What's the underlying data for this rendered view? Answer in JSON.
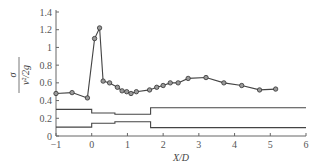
{
  "chart_data": {
    "type": "line",
    "title": "",
    "xlabel": "X/D",
    "ylabel": "σ / (v²/2g)",
    "ylabel_num": "σ",
    "ylabel_den": "v²/2g",
    "xlim": [
      -1,
      6
    ],
    "ylim": [
      0,
      1.4
    ],
    "xticks": [
      -1,
      0,
      1,
      2,
      3,
      4,
      5,
      6
    ],
    "xtick_labels": [
      "−1",
      "0",
      "1",
      "2",
      "3",
      "4",
      "5",
      "6"
    ],
    "yticks": [
      0,
      0.2,
      0.4,
      0.6,
      0.8,
      1,
      1.2,
      1.4
    ],
    "ytick_labels": [
      "0",
      "0.2",
      "0.4",
      "0.6",
      "0.8",
      "1",
      "1.2",
      "1.4"
    ],
    "grid": false,
    "legend": null,
    "series": [
      {
        "name": "measured",
        "marker": "circle",
        "x": [
          -1.0,
          -0.55,
          -0.12,
          0.08,
          0.22,
          0.32,
          0.5,
          0.72,
          0.85,
          0.98,
          1.1,
          1.25,
          1.62,
          1.82,
          2.0,
          2.2,
          2.42,
          2.7,
          3.2,
          3.7,
          4.2,
          4.7,
          5.15
        ],
        "y": [
          0.48,
          0.49,
          0.43,
          1.1,
          1.22,
          0.62,
          0.6,
          0.55,
          0.51,
          0.5,
          0.48,
          0.5,
          0.52,
          0.55,
          0.57,
          0.6,
          0.6,
          0.65,
          0.66,
          0.6,
          0.57,
          0.52,
          0.53
        ]
      },
      {
        "name": "upper-boundary",
        "marker": "none",
        "step": true,
        "x": [
          -1,
          0,
          0,
          0.65,
          0.65,
          1.65,
          1.65,
          6
        ],
        "y": [
          0.3,
          0.3,
          0.26,
          0.26,
          0.245,
          0.245,
          0.32,
          0.32
        ]
      },
      {
        "name": "lower-boundary",
        "marker": "none",
        "step": true,
        "x": [
          -1,
          0,
          0,
          0.65,
          0.65,
          1.65,
          1.65,
          6
        ],
        "y": [
          0.1,
          0.1,
          0.145,
          0.145,
          0.16,
          0.16,
          0.095,
          0.095
        ]
      }
    ]
  }
}
